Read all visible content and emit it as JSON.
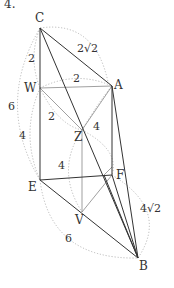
{
  "corner_fragment": "4.",
  "points": {
    "C": {
      "label": "C",
      "x": 40,
      "y": 28
    },
    "A": {
      "label": "A",
      "x": 112,
      "y": 86
    },
    "W": {
      "label": "W",
      "x": 40,
      "y": 88
    },
    "Z": {
      "label": "Z",
      "x": 82,
      "y": 130
    },
    "E": {
      "label": "E",
      "x": 40,
      "y": 180
    },
    "F": {
      "label": "F",
      "x": 112,
      "y": 175
    },
    "V": {
      "label": "V",
      "x": 82,
      "y": 212
    },
    "B": {
      "label": "B",
      "x": 138,
      "y": 258
    }
  },
  "measures": {
    "CA": "2√2",
    "CW": "2",
    "WA": "2",
    "WZ": "2",
    "ZA": "4",
    "CE": "6",
    "WE": "4",
    "ZV": "4",
    "FB": "4√2",
    "EB": "6"
  }
}
